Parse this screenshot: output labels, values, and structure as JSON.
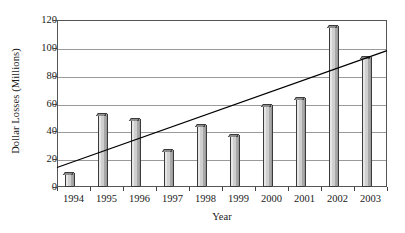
{
  "chart_data": {
    "type": "bar",
    "title": "",
    "xlabel": "Year",
    "ylabel": "Dollar Losses (Millions)",
    "categories": [
      "1994",
      "1995",
      "1996",
      "1997",
      "1998",
      "1999",
      "2000",
      "2001",
      "2002",
      "2003"
    ],
    "values": [
      9,
      52,
      48,
      26,
      44,
      37,
      58,
      63,
      115,
      93
    ],
    "series": [
      {
        "name": "Dollar Losses",
        "type": "bar",
        "values": [
          9,
          52,
          48,
          26,
          44,
          37,
          58,
          63,
          115,
          93
        ]
      },
      {
        "name": "Trend line",
        "type": "line",
        "endpoints": [
          14,
          98
        ]
      }
    ],
    "ylim": [
      0,
      120
    ],
    "yticks": [
      0,
      20,
      40,
      60,
      80,
      100,
      120
    ],
    "ytick_labels": [
      "0",
      "20",
      "40",
      "60",
      "80",
      "100",
      "120"
    ],
    "xtick_labels": [
      "1994",
      "1995",
      "1996",
      "1997",
      "1998",
      "1999",
      "2000",
      "2001",
      "2002",
      "2003"
    ],
    "grid": true,
    "grid_axis": "y",
    "legend": false,
    "legend_position": "none",
    "colors": {
      "bar_fill": "#cfcfcf",
      "bar_edge": "#3a3a3a",
      "bar_shade": "#8e8e8e",
      "trendline": "#000000",
      "gridline": "#9a9a9a",
      "frame": "#555555",
      "background": "#ffffff",
      "text": "#1a1a1a"
    }
  }
}
